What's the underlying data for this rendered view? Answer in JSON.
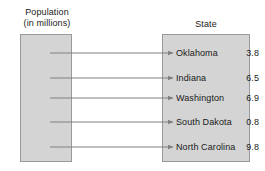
{
  "diagram": {
    "title_left_line1": "Population",
    "title_left_line2": "(in millions)",
    "title_right": "State",
    "type": "mapping-diagram",
    "box_fill_color": "#d4d4d4",
    "box_border_color": "#9a9a9a",
    "connector_color": "#808080",
    "text_color": "#1a1a1a"
  },
  "left_set": {
    "name": "Population (in millions)",
    "items": [
      {
        "label": "3.8"
      },
      {
        "label": "6.5"
      },
      {
        "label": "6.9"
      },
      {
        "label": "0.8"
      },
      {
        "label": "9.8"
      }
    ]
  },
  "right_set": {
    "name": "State",
    "items": [
      {
        "label": "Oklahoma"
      },
      {
        "label": "Indiana"
      },
      {
        "label": "Washington"
      },
      {
        "label": "South Dakota"
      },
      {
        "label": "North Carolina"
      }
    ]
  },
  "mappings": [
    {
      "from": "3.8",
      "to": "Oklahoma"
    },
    {
      "from": "6.5",
      "to": "Indiana"
    },
    {
      "from": "6.9",
      "to": "Washington"
    },
    {
      "from": "0.8",
      "to": "South Dakota"
    },
    {
      "from": "9.8",
      "to": "North Carolina"
    }
  ]
}
